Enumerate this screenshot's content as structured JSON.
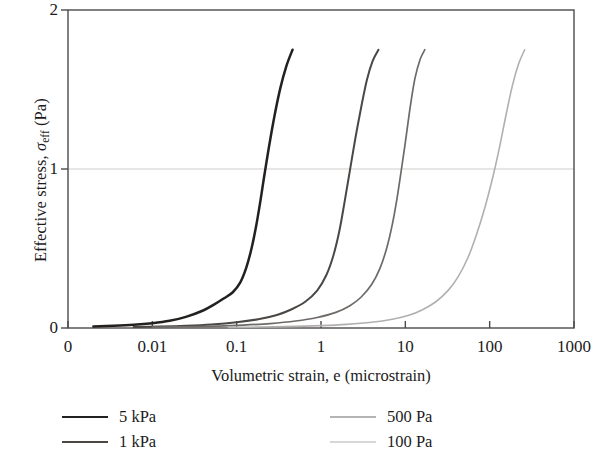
{
  "chart_data": {
    "type": "line",
    "title": "",
    "xlabel": "Volumetric strain, e (microstrain)",
    "ylabel": "Effective stress, σeff (Pa)",
    "ylabel_parts": {
      "prefix": "Effective stress, ",
      "symbol": "σ",
      "subscript": "eff",
      "suffix": " (Pa)"
    },
    "x_scale": "log",
    "y_scale": "linear",
    "xlim": [
      0.001,
      1000
    ],
    "ylim": [
      0,
      2
    ],
    "x_tick_labels": [
      "0",
      "0.01",
      "0.1",
      "1",
      "10",
      "100",
      "1000"
    ],
    "y_tick_labels": [
      "0",
      "1",
      "2"
    ],
    "y_ticks": [
      0,
      1,
      2
    ],
    "grid": "horizontal-gridline-at-y-1",
    "legend_position": "below-axis",
    "series": [
      {
        "name": "5 kPa",
        "color": "#23211f",
        "width": 2.5,
        "points": [
          [
            0.002,
            0.01
          ],
          [
            0.0035,
            0.014
          ],
          [
            0.006,
            0.02
          ],
          [
            0.01,
            0.03
          ],
          [
            0.016,
            0.045
          ],
          [
            0.025,
            0.07
          ],
          [
            0.04,
            0.11
          ],
          [
            0.055,
            0.15
          ],
          [
            0.07,
            0.185
          ],
          [
            0.09,
            0.225
          ],
          [
            0.11,
            0.285
          ],
          [
            0.13,
            0.38
          ],
          [
            0.15,
            0.5
          ],
          [
            0.17,
            0.64
          ],
          [
            0.19,
            0.79
          ],
          [
            0.21,
            0.94
          ],
          [
            0.24,
            1.13
          ],
          [
            0.28,
            1.33
          ],
          [
            0.33,
            1.51
          ],
          [
            0.39,
            1.65
          ],
          [
            0.46,
            1.75
          ]
        ]
      },
      {
        "name": "1 kPa",
        "color": "#4a4745",
        "width": 2.0,
        "points": [
          [
            0.006,
            0.006
          ],
          [
            0.012,
            0.009
          ],
          [
            0.025,
            0.014
          ],
          [
            0.05,
            0.022
          ],
          [
            0.1,
            0.036
          ],
          [
            0.18,
            0.055
          ],
          [
            0.3,
            0.082
          ],
          [
            0.45,
            0.118
          ],
          [
            0.65,
            0.165
          ],
          [
            0.9,
            0.235
          ],
          [
            1.15,
            0.33
          ],
          [
            1.4,
            0.455
          ],
          [
            1.65,
            0.61
          ],
          [
            1.9,
            0.79
          ],
          [
            2.2,
            0.99
          ],
          [
            2.55,
            1.19
          ],
          [
            3.0,
            1.39
          ],
          [
            3.5,
            1.56
          ],
          [
            4.1,
            1.68
          ],
          [
            4.8,
            1.75
          ]
        ]
      },
      {
        "name": "500 Pa",
        "color": "#6d6a68",
        "width": 1.7,
        "points": [
          [
            0.01,
            0.005
          ],
          [
            0.025,
            0.008
          ],
          [
            0.06,
            0.012
          ],
          [
            0.12,
            0.018
          ],
          [
            0.25,
            0.028
          ],
          [
            0.5,
            0.044
          ],
          [
            0.9,
            0.066
          ],
          [
            1.5,
            0.098
          ],
          [
            2.2,
            0.14
          ],
          [
            3.0,
            0.195
          ],
          [
            4.0,
            0.275
          ],
          [
            5.0,
            0.375
          ],
          [
            6.0,
            0.5
          ],
          [
            7.0,
            0.65
          ],
          [
            8.0,
            0.82
          ],
          [
            9.0,
            1.0
          ],
          [
            10.2,
            1.2
          ],
          [
            11.5,
            1.4
          ],
          [
            13.0,
            1.57
          ],
          [
            15.0,
            1.69
          ],
          [
            17.0,
            1.75
          ]
        ]
      },
      {
        "name": "100 Pa",
        "color": "#b2b0ae",
        "width": 1.6,
        "points": [
          [
            0.08,
            0.004
          ],
          [
            0.2,
            0.006
          ],
          [
            0.5,
            0.01
          ],
          [
            1.0,
            0.015
          ],
          [
            2.0,
            0.023
          ],
          [
            4.0,
            0.036
          ],
          [
            7.0,
            0.055
          ],
          [
            11.0,
            0.08
          ],
          [
            16.0,
            0.115
          ],
          [
            23.0,
            0.165
          ],
          [
            32.0,
            0.235
          ],
          [
            42.0,
            0.32
          ],
          [
            55.0,
            0.44
          ],
          [
            70.0,
            0.59
          ],
          [
            88.0,
            0.76
          ],
          [
            108.0,
            0.94
          ],
          [
            130.0,
            1.13
          ],
          [
            155.0,
            1.33
          ],
          [
            185.0,
            1.52
          ],
          [
            220.0,
            1.66
          ],
          [
            260.0,
            1.75
          ]
        ]
      }
    ],
    "legend_entries": [
      "5 kPa",
      "1 kPa",
      "500 Pa",
      "100 Pa"
    ],
    "axis_color": "#4d4b4a",
    "gridline_color": "#cfcdcb"
  }
}
